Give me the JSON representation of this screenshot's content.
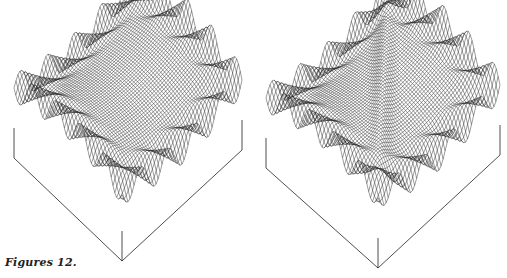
{
  "caption": "Figures 12.",
  "figures": [
    {
      "id": "left",
      "description": "3D wireframe surface plot over square domain, symmetric saddle with ridges along both diagonals and oscillating edges",
      "box": {
        "left": [
          14,
          158
        ],
        "bottom": [
          122,
          261
        ],
        "right": [
          242,
          150
        ],
        "height": 30
      },
      "surface_variant": "symmetric"
    },
    {
      "id": "right",
      "description": "3D wireframe surface plot over square domain, saddle with sharp ridge along one diagonal and oscillating edges",
      "box": {
        "left": [
          12,
          168
        ],
        "bottom": [
          124,
          268
        ],
        "right": [
          246,
          155
        ],
        "height": 30
      },
      "surface_variant": "diagonal-ridge"
    }
  ],
  "colors": {
    "ink": "#222222",
    "background": "#ffffff"
  }
}
